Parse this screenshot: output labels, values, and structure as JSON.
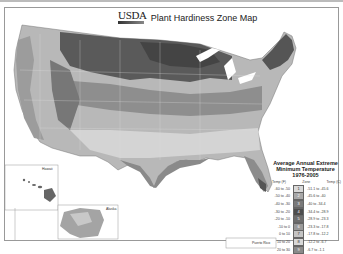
{
  "header": {
    "logo": "USDA",
    "title": "Plant Hardiness Zone Map"
  },
  "insets": {
    "hawaii": "Hawaii",
    "alaska": "Alaska",
    "puerto_rico": "Puerto Rico"
  },
  "legend": {
    "title_line1": "Average Annual Extreme",
    "title_line2": "Minimum Temperature",
    "title_line3": "1976-2005",
    "col_f": "Temp (F)",
    "col_zone": "Zone",
    "col_c": "Temp (C)",
    "rows": [
      {
        "f": "-60 to -50",
        "zone": "1",
        "c": "-51.1 to -45.6",
        "color": "#d9d9d9"
      },
      {
        "f": "-50 to -40",
        "zone": "2",
        "c": "-45.6 to -40",
        "color": "#a8a8a8"
      },
      {
        "f": "-40 to -30",
        "zone": "3",
        "c": "-40 to -34.4",
        "color": "#7a7a7a"
      },
      {
        "f": "-30 to -20",
        "zone": "4",
        "c": "-34.4 to -28.9",
        "color": "#4e4e4e"
      },
      {
        "f": "-20 to -10",
        "zone": "5",
        "c": "-28.9 to -23.3",
        "color": "#6e6e6e"
      },
      {
        "f": "-10 to 0",
        "zone": "6",
        "c": "-23.3 to -17.8",
        "color": "#9a9a9a"
      },
      {
        "f": "0 to 10",
        "zone": "7",
        "c": "-17.8 to -12.2",
        "color": "#c4c4c4"
      },
      {
        "f": "10 to 20",
        "zone": "8",
        "c": "-12.2 to -6.7",
        "color": "#d8d8d8"
      },
      {
        "f": "20 to 30",
        "zone": "9",
        "c": "-6.7 to -1.1",
        "color": "#8a8a8a"
      }
    ]
  }
}
